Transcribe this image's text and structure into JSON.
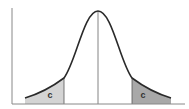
{
  "diagram": {
    "type": "normal-distribution",
    "left_tail": {
      "label": "c",
      "fill": "#d4d4d4"
    },
    "right_tail": {
      "label": "c",
      "fill": "#a8a8a8"
    },
    "curve_color": "#2a2a2a",
    "axis_color": "#888888",
    "center_line_color": "#666666"
  }
}
